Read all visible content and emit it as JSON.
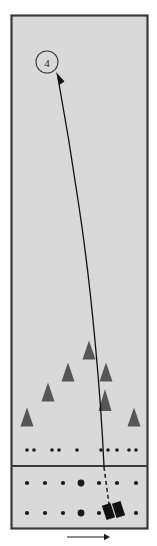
{
  "figure": {
    "background_color": "#ffffff",
    "panel_fill": "#d9d9d9",
    "frame_color": "#3a3a3a",
    "ink_color": "#1a1a1a"
  },
  "frame": {
    "x": 11,
    "y": 15,
    "width": 136,
    "height": 513,
    "divider_y": 466
  },
  "callout": {
    "label": "4",
    "circle_cx": 47,
    "circle_cy": 62,
    "circle_r": 11,
    "stroke_color": "#3a3a3a"
  },
  "trajectory": {
    "name": "curved-trajectory-path",
    "path": "M 104 466 C 101 400 92 290 78 200 C 70 145 62 100 58 78",
    "arrow_tip_x": 56,
    "arrow_tip_y": 72,
    "color": "#111111",
    "width": 1.3
  },
  "dashed_line": {
    "name": "dashed-extension-line",
    "x1": 104,
    "y1": 467,
    "x2": 110,
    "y2": 512,
    "dash": "4,3",
    "color": "#2a2a2a"
  },
  "triangles": {
    "name": "triangle-markers",
    "color": "#565656",
    "items": [
      {
        "cx": 27,
        "cy": 417,
        "w": 13,
        "h": 19
      },
      {
        "cx": 48,
        "cy": 392,
        "w": 13,
        "h": 19
      },
      {
        "cx": 68,
        "cy": 372,
        "w": 13,
        "h": 19
      },
      {
        "cx": 89,
        "cy": 350,
        "w": 13,
        "h": 19
      },
      {
        "cx": 106,
        "cy": 372,
        "w": 13,
        "h": 19
      },
      {
        "cx": 105,
        "cy": 400,
        "w": 13,
        "h": 22
      },
      {
        "cx": 134,
        "cy": 417,
        "w": 13,
        "h": 19
      }
    ]
  },
  "upper_dots": {
    "name": "upper-dot-row",
    "color": "#1a1a1a",
    "y": 450,
    "radius": 1.8,
    "x_positions": [
      27,
      34,
      52,
      59,
      77,
      101,
      108,
      117,
      129,
      136
    ]
  },
  "lower_panel_dots": {
    "name": "lower-dot-grid",
    "color": "#1a1a1a",
    "rows": [
      {
        "y": 483,
        "dots": [
          {
            "x": 27,
            "r": 2.1
          },
          {
            "x": 45,
            "r": 2.1
          },
          {
            "x": 63,
            "r": 2.1
          },
          {
            "x": 81,
            "r": 3.4
          },
          {
            "x": 99,
            "r": 2.1
          },
          {
            "x": 117,
            "r": 2.1
          },
          {
            "x": 136,
            "r": 2.1
          }
        ]
      },
      {
        "y": 513,
        "dots": [
          {
            "x": 27,
            "r": 2.1
          },
          {
            "x": 45,
            "r": 2.1
          },
          {
            "x": 63,
            "r": 2.1
          },
          {
            "x": 81,
            "r": 3.4
          },
          {
            "x": 99,
            "r": 2.1
          },
          {
            "x": 136,
            "r": 2.1
          }
        ]
      }
    ]
  },
  "block_marker": {
    "name": "black-block-marker",
    "color": "#111111",
    "blocks": [
      {
        "x": 104,
        "y": 504,
        "w": 9,
        "h": 15,
        "rotate": -18
      },
      {
        "x": 114,
        "y": 502,
        "w": 9,
        "h": 15,
        "rotate": -18
      }
    ]
  },
  "direction_arrow": {
    "name": "direction-arrow",
    "x1": 67,
    "x2": 110,
    "y": 537,
    "color": "#1a1a1a"
  }
}
